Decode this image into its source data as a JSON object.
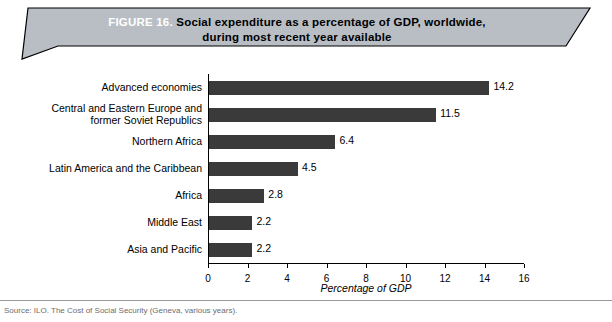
{
  "banner": {
    "figure_label": "FIGURE 16.",
    "title_line1": "Social expenditure as a percentage of GDP, worldwide,",
    "title_line2": "during most recent year available",
    "fill_color": "#b9bec4",
    "border_color": "#000000"
  },
  "footer": {
    "source_note": "Source: ILO. The Cost of Social Security (Geneva, various years)."
  },
  "chart_data": {
    "type": "bar",
    "orientation": "horizontal",
    "title": "Social expenditure as a percentage of GDP, worldwide, during most recent year available",
    "categories": [
      "Advanced economies",
      "Central and Eastern Europe and former Soviet Republics",
      "Northern Africa",
      "Latin America and the Caribbean",
      "Africa",
      "Middle East",
      "Asia and Pacific"
    ],
    "category_lines": [
      [
        "Advanced  economies"
      ],
      [
        "Central and Eastern Europe and",
        "former Soviet Republics"
      ],
      [
        "Northern Africa"
      ],
      [
        "Latin America and the Caribbean"
      ],
      [
        "Africa"
      ],
      [
        "Middle East"
      ],
      [
        "Asia and Pacific"
      ]
    ],
    "values": [
      14.2,
      11.5,
      6.4,
      4.5,
      2.8,
      2.2,
      2.2
    ],
    "value_labels": [
      "14.2",
      "11.5",
      "6.4",
      "4.5",
      "2.8",
      "2.2",
      "2.2"
    ],
    "xlabel": "Percentage of GDP",
    "ylabel": "",
    "xlim": [
      0,
      16
    ],
    "xticks": [
      0,
      2,
      4,
      6,
      8,
      10,
      12,
      14,
      16
    ],
    "xtick_labels": [
      "0",
      "2",
      "4",
      "6",
      "8",
      "10",
      "12",
      "14",
      "16"
    ],
    "grid": false,
    "legend": false,
    "bar_color": "#3a3a3a"
  }
}
